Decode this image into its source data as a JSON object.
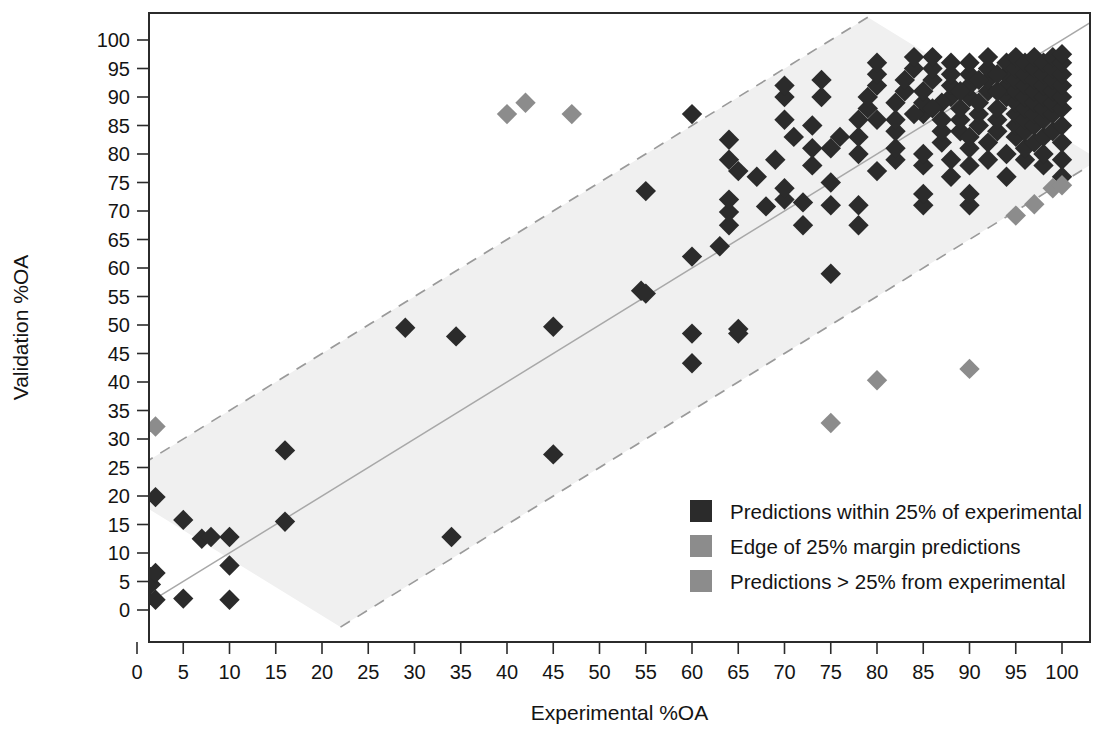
{
  "figure": {
    "background": "#ffffff",
    "plot_frame_color": "#2b2b2b"
  },
  "axes": {
    "x_title": "Experimental %OA",
    "y_title": "Validation %OA",
    "x_ticks": [
      "0",
      "5",
      "10",
      "15",
      "20",
      "25",
      "30",
      "35",
      "40",
      "45",
      "50",
      "55",
      "60",
      "65",
      "70",
      "75",
      "80",
      "85",
      "90",
      "95",
      "100"
    ],
    "y_ticks": [
      "0",
      "5",
      "10",
      "15",
      "20",
      "25",
      "30",
      "35",
      "40",
      "45",
      "50",
      "55",
      "60",
      "65",
      "70",
      "75",
      "80",
      "85",
      "90",
      "95",
      "100"
    ]
  },
  "legend": {
    "items": [
      {
        "label": "Predictions within 25% of experimental",
        "color": "#2b2b2b",
        "swatch": "square-swatch"
      },
      {
        "label": "Edge of 25% margin predictions",
        "color": "#8c8c8c",
        "swatch": "square-swatch"
      },
      {
        "label": "Predictions > 25% from experimental",
        "color": "#8c8c8c",
        "swatch": "square-swatch"
      }
    ]
  },
  "chart_data": {
    "type": "scatter",
    "title": "",
    "xlabel": "Experimental %OA",
    "ylabel": "Validation %OA",
    "xlim": [
      -3,
      105
    ],
    "ylim": [
      -6,
      104
    ],
    "grid": false,
    "legend_position": "inside-lower-right",
    "reference_lines": [
      {
        "name": "identity",
        "type": "line",
        "from": [
          -3,
          -3
        ],
        "to": [
          104,
          104
        ],
        "style": "solid",
        "color": "#a8a8a8"
      },
      {
        "name": "upper-25pct-margin",
        "type": "line",
        "from": [
          -3,
          22
        ],
        "to": [
          79,
          104
        ],
        "style": "dashed",
        "color": "#9a9a9a"
      },
      {
        "name": "lower-25pct-margin",
        "type": "line",
        "from": [
          22,
          -3
        ],
        "to": [
          104,
          79
        ],
        "style": "dashed",
        "color": "#9a9a9a"
      }
    ],
    "shaded_band": {
      "name": "25-percent-margin-band",
      "fill": "#f0f0f0",
      "description": "region between the two dashed +/-25 percentage-point margin lines"
    },
    "series": [
      {
        "name": "Predictions within 25% of experimental",
        "color": "#2b2b2b",
        "marker": "diamond",
        "points": [
          [
            0,
            0.5
          ],
          [
            0,
            2
          ],
          [
            0,
            4
          ],
          [
            0,
            5
          ],
          [
            0,
            6
          ],
          [
            0,
            7.5
          ],
          [
            0,
            9.5
          ],
          [
            1,
            5
          ],
          [
            1,
            6.5
          ],
          [
            1,
            2
          ],
          [
            1.5,
            4.5
          ],
          [
            2,
            6.5
          ],
          [
            2,
            19.8
          ],
          [
            2,
            1.8
          ],
          [
            5,
            15.8
          ],
          [
            5,
            2
          ],
          [
            7,
            12.5
          ],
          [
            8,
            12.8
          ],
          [
            10,
            12.8
          ],
          [
            10,
            7.8
          ],
          [
            10,
            1.8
          ],
          [
            16,
            15.5
          ],
          [
            16,
            28
          ],
          [
            29,
            49.5
          ],
          [
            34,
            12.8
          ],
          [
            34.5,
            48
          ],
          [
            45,
            27.3
          ],
          [
            45,
            49.7
          ],
          [
            54.5,
            56
          ],
          [
            55,
            55.5
          ],
          [
            55,
            73.5
          ],
          [
            60,
            43.3
          ],
          [
            60,
            48.5
          ],
          [
            60,
            62
          ],
          [
            60,
            87
          ],
          [
            63,
            63.8
          ],
          [
            64,
            69.8
          ],
          [
            64,
            67.5
          ],
          [
            64,
            72
          ],
          [
            64,
            79
          ],
          [
            64,
            82.5
          ],
          [
            65,
            48.5
          ],
          [
            65,
            49.3
          ],
          [
            65,
            77
          ],
          [
            68,
            70.8
          ],
          [
            70,
            72
          ],
          [
            70,
            74
          ],
          [
            70,
            86
          ],
          [
            70,
            90
          ],
          [
            70,
            92
          ],
          [
            72,
            71.5
          ],
          [
            72,
            67.5
          ],
          [
            73,
            78
          ],
          [
            73,
            81
          ],
          [
            74,
            90
          ],
          [
            74,
            93
          ],
          [
            75,
            59
          ],
          [
            75,
            71
          ],
          [
            75,
            75
          ],
          [
            78,
            67.5
          ],
          [
            78,
            71
          ],
          [
            78,
            80
          ],
          [
            78,
            83
          ],
          [
            79,
            88
          ],
          [
            79,
            90
          ],
          [
            80,
            77
          ],
          [
            80,
            92
          ],
          [
            80,
            94
          ],
          [
            80,
            96
          ],
          [
            82,
            79
          ],
          [
            82,
            81
          ],
          [
            82,
            84
          ],
          [
            82,
            86
          ],
          [
            83,
            91
          ],
          [
            83,
            93
          ],
          [
            84,
            95
          ],
          [
            84,
            97
          ],
          [
            85,
            71
          ],
          [
            85,
            73
          ],
          [
            85,
            78
          ],
          [
            85,
            80
          ],
          [
            85,
            87
          ],
          [
            85,
            89
          ],
          [
            85,
            91
          ],
          [
            86,
            93
          ],
          [
            86,
            95
          ],
          [
            86,
            97
          ],
          [
            87,
            82
          ],
          [
            87,
            84
          ],
          [
            87,
            86
          ],
          [
            88,
            76
          ],
          [
            88,
            79
          ],
          [
            88,
            90
          ],
          [
            88,
            92
          ],
          [
            88,
            94
          ],
          [
            88,
            96
          ],
          [
            89,
            84
          ],
          [
            89,
            86
          ],
          [
            89,
            88
          ],
          [
            90,
            71
          ],
          [
            90,
            73
          ],
          [
            90,
            78
          ],
          [
            90,
            81
          ],
          [
            90,
            83
          ],
          [
            90,
            90
          ],
          [
            90,
            92
          ],
          [
            90,
            94
          ],
          [
            90,
            96
          ],
          [
            91,
            85
          ],
          [
            91,
            87
          ],
          [
            91,
            89
          ],
          [
            92,
            79
          ],
          [
            92,
            82
          ],
          [
            92,
            91
          ],
          [
            92,
            93
          ],
          [
            92,
            95
          ],
          [
            92,
            97
          ],
          [
            93,
            84
          ],
          [
            93,
            86
          ],
          [
            93,
            88
          ],
          [
            94,
            76
          ],
          [
            94,
            80
          ],
          [
            94,
            90
          ],
          [
            94,
            92
          ],
          [
            94,
            94
          ],
          [
            94,
            96
          ],
          [
            95,
            83
          ],
          [
            95,
            85
          ],
          [
            95,
            87
          ],
          [
            95,
            89
          ],
          [
            95,
            91
          ],
          [
            95,
            93
          ],
          [
            95,
            95
          ],
          [
            95,
            97
          ],
          [
            96,
            79
          ],
          [
            96,
            81
          ],
          [
            96,
            84
          ],
          [
            96,
            86
          ],
          [
            96,
            88
          ],
          [
            96,
            90
          ],
          [
            96,
            92
          ],
          [
            96,
            94
          ],
          [
            96,
            96
          ],
          [
            97,
            82
          ],
          [
            97,
            85
          ],
          [
            97,
            87
          ],
          [
            97,
            89
          ],
          [
            97,
            91
          ],
          [
            97,
            93
          ],
          [
            97,
            95
          ],
          [
            97,
            97
          ],
          [
            98,
            78
          ],
          [
            98,
            80
          ],
          [
            98,
            83
          ],
          [
            98,
            86
          ],
          [
            98,
            88
          ],
          [
            98,
            90
          ],
          [
            98,
            92
          ],
          [
            98,
            94
          ],
          [
            98,
            96
          ],
          [
            99,
            84
          ],
          [
            99,
            87
          ],
          [
            99,
            89
          ],
          [
            99,
            91
          ],
          [
            99,
            93
          ],
          [
            99,
            95
          ],
          [
            99,
            97
          ],
          [
            100,
            76
          ],
          [
            100,
            79
          ],
          [
            100,
            82
          ],
          [
            100,
            85
          ],
          [
            100,
            88
          ],
          [
            100,
            90
          ],
          [
            100,
            92
          ],
          [
            100,
            94
          ],
          [
            100,
            96
          ],
          [
            100,
            97.5
          ],
          [
            93,
            91
          ],
          [
            93,
            94
          ],
          [
            91,
            93
          ],
          [
            89,
            91
          ],
          [
            87,
            89
          ],
          [
            86,
            88
          ],
          [
            84,
            87
          ],
          [
            82,
            89
          ],
          [
            80,
            86
          ],
          [
            78,
            86
          ],
          [
            76,
            83
          ],
          [
            75,
            81
          ],
          [
            73,
            85
          ],
          [
            71,
            83
          ],
          [
            69,
            79
          ],
          [
            67,
            76
          ]
        ]
      },
      {
        "name": "Edge of 25% margin predictions",
        "color": "#8c8c8c",
        "marker": "diamond",
        "points": [
          [
            95,
            69.2
          ],
          [
            97,
            71.2
          ],
          [
            99,
            74
          ],
          [
            100,
            74.5
          ]
        ]
      },
      {
        "name": "Predictions > 25% from experimental",
        "color": "#8c8c8c",
        "marker": "diamond",
        "points": [
          [
            2,
            32.2
          ],
          [
            40,
            87
          ],
          [
            42,
            89
          ],
          [
            47,
            87
          ],
          [
            75,
            32.8
          ],
          [
            80,
            40.3
          ],
          [
            90,
            42.3
          ]
        ]
      }
    ]
  }
}
